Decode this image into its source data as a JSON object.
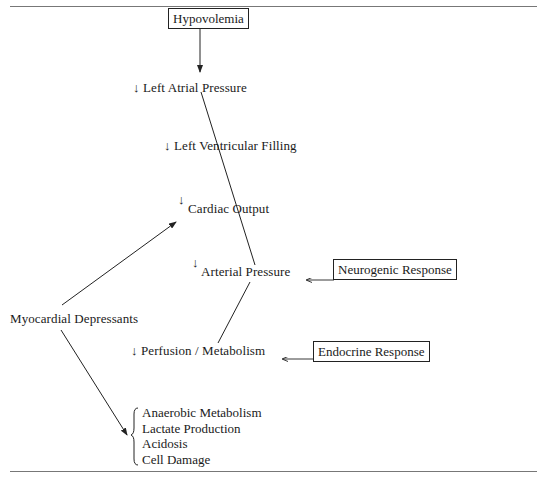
{
  "diagram": {
    "type": "flowchart",
    "nodes": {
      "hypovolemia": "Hypovolemia",
      "left_atrial_pressure": "Left Atrial Pressure",
      "left_ventricular_filling": "Left Ventricular Filling",
      "cardiac_output": "Cardiac Output",
      "arterial_pressure": "Arterial Pressure",
      "neurogenic_response": "Neurogenic Response",
      "myocardial_depressants": "Myocardial Depressants",
      "perfusion_metabolism": "Perfusion / Metabolism",
      "endocrine_response": "Endocrine Response"
    },
    "decrease_symbol": "↓",
    "outcomes": [
      "Anaerobic Metabolism",
      "Lactate Production",
      "Acidosis",
      "Cell Damage"
    ],
    "edges": [
      {
        "from": "Hypovolemia",
        "to": "Left Atrial Pressure"
      },
      {
        "from": "Left Atrial Pressure",
        "to": "Left Ventricular Filling"
      },
      {
        "from": "Left Ventricular Filling",
        "to": "Cardiac Output"
      },
      {
        "from": "Cardiac Output",
        "to": "Arterial Pressure"
      },
      {
        "from": "Neurogenic Response",
        "to": "Arterial Pressure"
      },
      {
        "from": "Arterial Pressure",
        "to": "Perfusion / Metabolism"
      },
      {
        "from": "Endocrine Response",
        "to": "Perfusion / Metabolism"
      },
      {
        "from": "Myocardial Depressants",
        "to": "Cardiac Output"
      },
      {
        "from": "Myocardial Depressants",
        "to": "Outcomes"
      }
    ]
  }
}
